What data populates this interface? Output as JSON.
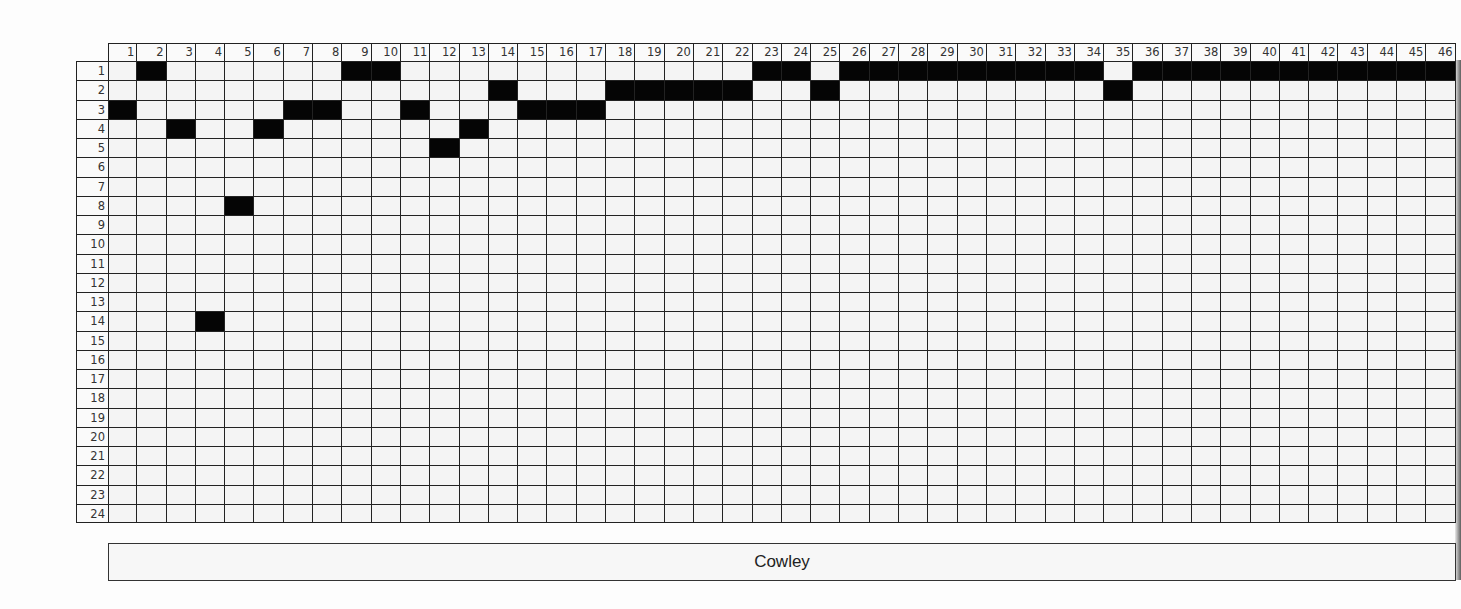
{
  "puzzle": {
    "columns": 46,
    "rows": 24,
    "column_labels": [
      "1",
      "2",
      "3",
      "4",
      "5",
      "6",
      "7",
      "8",
      "9",
      "10",
      "11",
      "12",
      "13",
      "14",
      "15",
      "16",
      "17",
      "18",
      "19",
      "20",
      "21",
      "22",
      "23",
      "24",
      "25",
      "26",
      "27",
      "28",
      "29",
      "30",
      "31",
      "32",
      "33",
      "34",
      "35",
      "36",
      "37",
      "38",
      "39",
      "40",
      "41",
      "42",
      "43",
      "44",
      "45",
      "46"
    ],
    "row_labels": [
      "1",
      "2",
      "3",
      "4",
      "5",
      "6",
      "7",
      "8",
      "9",
      "10",
      "11",
      "12",
      "13",
      "14",
      "15",
      "16",
      "17",
      "18",
      "19",
      "20",
      "21",
      "22",
      "23",
      "24"
    ],
    "filled_cells": {
      "1": [
        2,
        9,
        10,
        23,
        24,
        26,
        27,
        28,
        29,
        30,
        31,
        32,
        33,
        34,
        36,
        37,
        38,
        39,
        40,
        41,
        42,
        43,
        44,
        45,
        46
      ],
      "2": [
        14,
        18,
        19,
        20,
        21,
        22,
        25,
        35
      ],
      "3": [
        1,
        7,
        8,
        11,
        15,
        16,
        17
      ],
      "4": [
        3,
        6,
        13
      ],
      "5": [
        12
      ],
      "8": [
        5
      ],
      "14": [
        4
      ]
    },
    "colors": {
      "filled": "#050505",
      "empty": "#f4f4f4",
      "grid_line": "#222222"
    }
  },
  "name_box": {
    "label": "Cowley"
  }
}
